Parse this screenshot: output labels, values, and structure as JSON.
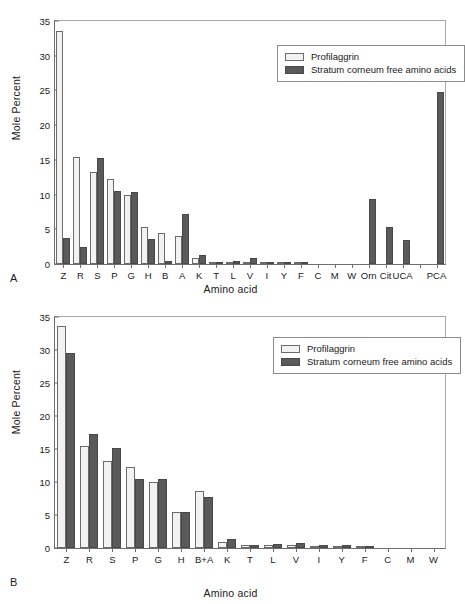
{
  "figure": {
    "panel_a_letter": "A",
    "panel_b_letter": "B"
  },
  "legend": {
    "series_0": "Profilaggrin",
    "series_1": "Stratum corneum free amino acids"
  },
  "colors": {
    "series_0_fill": "#f2f2f2",
    "series_0_edge": "#6b6b6b",
    "series_1_fill": "#5a5a5a",
    "series_1_edge": "#484848",
    "axis": "#6e6e6e"
  },
  "chart_data": [
    {
      "panel": "A",
      "type": "bar",
      "title": "",
      "xlabel": "Amino acid",
      "ylabel": "Mole Percent",
      "ylim": [
        0,
        35
      ],
      "yticks": [
        0,
        5,
        10,
        15,
        20,
        25,
        30,
        35
      ],
      "grid": false,
      "legend_position": "top-right",
      "categories": [
        "Z",
        "R",
        "S",
        "P",
        "G",
        "H",
        "B",
        "A",
        "K",
        "T",
        "L",
        "V",
        "I",
        "Y",
        "F",
        "C",
        "M",
        "W",
        "Orn",
        "Cit",
        "UCA",
        "",
        "PCA"
      ],
      "series": [
        {
          "name": "Profilaggrin",
          "values": [
            33.6,
            15.4,
            13.2,
            12.2,
            10.0,
            5.4,
            4.5,
            4.1,
            0.9,
            0.3,
            0.3,
            0.3,
            0.2,
            0.2,
            0.1,
            0.0,
            0.0,
            0.0,
            0.0,
            0.0,
            0.0,
            0.0,
            0.0
          ]
        },
        {
          "name": "Stratum corneum free amino acids",
          "values": [
            3.7,
            2.4,
            15.2,
            10.5,
            10.4,
            3.6,
            0.4,
            7.2,
            1.3,
            0.3,
            0.5,
            0.8,
            0.3,
            0.3,
            0.2,
            0.0,
            0.0,
            0.0,
            9.4,
            5.3,
            3.5,
            0.0,
            24.8
          ]
        }
      ]
    },
    {
      "panel": "B",
      "type": "bar",
      "title": "",
      "xlabel": "Amino acid",
      "ylabel": "Mole Percent",
      "ylim": [
        0,
        35
      ],
      "yticks": [
        0,
        5,
        10,
        15,
        20,
        25,
        30,
        35
      ],
      "grid": false,
      "legend_position": "top-right",
      "categories": [
        "Z",
        "R",
        "S",
        "P",
        "G",
        "H",
        "B+A",
        "K",
        "T",
        "L",
        "V",
        "I",
        "Y",
        "F",
        "C",
        "M",
        "W"
      ],
      "series": [
        {
          "name": "Profilaggrin",
          "values": [
            33.6,
            15.4,
            13.2,
            12.2,
            10.0,
            5.4,
            8.6,
            0.9,
            0.4,
            0.4,
            0.5,
            0.3,
            0.3,
            0.2,
            0.0,
            0.0,
            0.0
          ]
        },
        {
          "name": "Stratum corneum free amino acids",
          "values": [
            29.5,
            17.3,
            15.2,
            10.5,
            10.4,
            5.4,
            7.8,
            1.4,
            0.4,
            0.6,
            0.8,
            0.4,
            0.4,
            0.2,
            0.0,
            0.0,
            0.0
          ]
        }
      ]
    }
  ]
}
